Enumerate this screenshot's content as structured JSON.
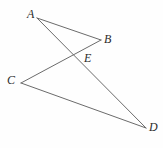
{
  "figure": {
    "background_color": "#fefefe",
    "stroke_color": "#6b6b6b",
    "label_color": "#2b2b2b",
    "width": 163,
    "height": 148,
    "points": [
      {
        "id": "A",
        "label": "A",
        "x": 37,
        "y": 18,
        "label_x": 27,
        "label_y": 8
      },
      {
        "id": "B",
        "label": "B",
        "x": 101,
        "y": 40,
        "label_x": 104,
        "label_y": 33
      },
      {
        "id": "E",
        "label": "E",
        "x": 75,
        "y": 54,
        "label_x": 84,
        "label_y": 52
      },
      {
        "id": "C",
        "label": "C",
        "x": 21,
        "y": 83,
        "label_x": 7,
        "label_y": 74
      },
      {
        "id": "D",
        "label": "D",
        "x": 146,
        "y": 128,
        "label_x": 149,
        "label_y": 121
      }
    ],
    "segments": [
      {
        "id": "AB",
        "from": "A",
        "to": "B"
      },
      {
        "id": "AD",
        "from": "A",
        "to": "D"
      },
      {
        "id": "CB",
        "from": "C",
        "to": "B"
      },
      {
        "id": "CD",
        "from": "C",
        "to": "D"
      }
    ]
  }
}
